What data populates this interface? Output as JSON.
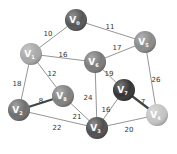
{
  "diagram": {
    "type": "weighted-undirected-graph",
    "nodes": [
      {
        "id": "V0",
        "letter": "V",
        "sub": "0",
        "x": 76,
        "y": 20,
        "color": "#555555"
      },
      {
        "id": "V1",
        "letter": "V",
        "sub": "1",
        "x": 31,
        "y": 54,
        "color": "#a8a8a8"
      },
      {
        "id": "V6",
        "letter": "V",
        "sub": "6",
        "x": 95,
        "y": 62,
        "color": "#7a7a7a"
      },
      {
        "id": "V5",
        "letter": "V",
        "sub": "5",
        "x": 145,
        "y": 42,
        "color": "#8a8a8a"
      },
      {
        "id": "V2",
        "letter": "V",
        "sub": "2",
        "x": 19,
        "y": 110,
        "color": "#6e6e6e"
      },
      {
        "id": "V8",
        "letter": "V",
        "sub": "8",
        "x": 63,
        "y": 96,
        "color": "#808080"
      },
      {
        "id": "V3",
        "letter": "V",
        "sub": "3",
        "x": 97,
        "y": 128,
        "color": "#4f4f4f"
      },
      {
        "id": "V7",
        "letter": "V",
        "sub": "7",
        "x": 124,
        "y": 90,
        "color": "#333333"
      },
      {
        "id": "V4",
        "letter": "V",
        "sub": "4",
        "x": 157,
        "y": 115,
        "color": "#c4c4c4"
      }
    ],
    "edges": [
      {
        "from": "V0",
        "to": "V1",
        "weight": "10",
        "lx": 48,
        "ly": 34,
        "bold": false
      },
      {
        "from": "V0",
        "to": "V5",
        "weight": "11",
        "lx": 110,
        "ly": 27,
        "bold": false
      },
      {
        "from": "V1",
        "to": "V6",
        "weight": "16",
        "lx": 63,
        "ly": 55,
        "bold": false
      },
      {
        "from": "V6",
        "to": "V5",
        "weight": "17",
        "lx": 117,
        "ly": 48,
        "bold": false
      },
      {
        "from": "V1",
        "to": "V2",
        "weight": "18",
        "lx": 17,
        "ly": 84,
        "bold": false
      },
      {
        "from": "V1",
        "to": "V8",
        "weight": "12",
        "lx": 52,
        "ly": 74,
        "bold": false
      },
      {
        "from": "V6",
        "to": "V7",
        "weight": "19",
        "lx": 109,
        "ly": 74,
        "bold": false
      },
      {
        "from": "V5",
        "to": "V4",
        "weight": "26",
        "lx": 156,
        "ly": 80,
        "bold": false
      },
      {
        "from": "V2",
        "to": "V8",
        "weight": "8",
        "lx": 41,
        "ly": 101,
        "bold": true
      },
      {
        "from": "V6",
        "to": "V3",
        "weight": "24",
        "lx": 88,
        "ly": 98,
        "bold": false
      },
      {
        "from": "V8",
        "to": "V3",
        "weight": "21",
        "lx": 77,
        "ly": 117,
        "bold": false
      },
      {
        "from": "V2",
        "to": "V3",
        "weight": "22",
        "lx": 57,
        "ly": 128,
        "bold": false
      },
      {
        "from": "V7",
        "to": "V3",
        "weight": "16",
        "lx": 106,
        "ly": 110,
        "bold": false
      },
      {
        "from": "V7",
        "to": "V4",
        "weight": "7",
        "lx": 143,
        "ly": 102,
        "bold": true
      },
      {
        "from": "V3",
        "to": "V4",
        "weight": "20",
        "lx": 129,
        "ly": 130,
        "bold": false
      }
    ],
    "node_radius": 11,
    "edge_color": "#7a7a7a",
    "bold_edge_color": "#444444"
  }
}
